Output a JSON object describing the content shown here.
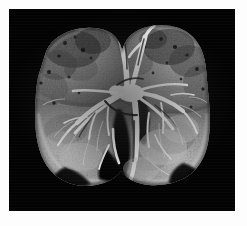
{
  "figure": {
    "kind": "anatomical-photograph",
    "modality": "macroscopic gross pathology photograph",
    "color_mode": "grayscale",
    "orientation": "coronal, anterior view",
    "background_color": "#030303",
    "page_color": "#ffffff",
    "border_color": "#ffffff"
  },
  "plate": {
    "frame_width_px": 9,
    "width_px": 226,
    "height_px": 202
  },
  "specimen": {
    "label": "lung-section",
    "lobes": [
      {
        "name": "right-upper-lobe",
        "side": "left-of-image",
        "tone": "#8f8f8f"
      },
      {
        "name": "right-lower-lobe",
        "side": "left-of-image",
        "tone": "#a3a3a3"
      },
      {
        "name": "left-upper-lobe",
        "side": "right-of-image",
        "tone": "#9a9a9a"
      },
      {
        "name": "left-lower-lobe",
        "side": "right-of-image",
        "tone": "#8a8a8a"
      }
    ],
    "features": [
      {
        "name": "hilar-bronchial-tree",
        "tone": "#f2f2f2"
      },
      {
        "name": "main-bronchus",
        "tone": "#ededed"
      },
      {
        "name": "pulmonary-vessels",
        "tone": "#e4e4e4"
      },
      {
        "name": "emphysematous-airspaces",
        "tone": "#1a1a1a"
      },
      {
        "name": "pleural-margin",
        "tone": "#d0d0d0"
      },
      {
        "name": "mottled-parenchyma",
        "tone": "#707070"
      }
    ]
  },
  "scale_bar": {
    "name": "ruler",
    "caption": "",
    "tick_interval_label": "",
    "bar_color": "#e8e8e8",
    "tick_color": "#141414"
  }
}
